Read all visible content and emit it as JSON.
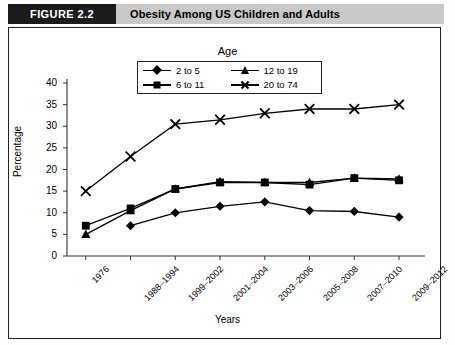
{
  "header": {
    "figure_tag": "FIGURE 2.2",
    "title": "Obesity Among US Children and Adults"
  },
  "chart_data": {
    "type": "line",
    "title": "Obesity Among US Children and Adults",
    "xlabel": "Years",
    "ylabel": "Percentage",
    "ylim": [
      0,
      40
    ],
    "ytick_values": [
      0,
      5,
      10,
      15,
      20,
      25,
      30,
      35,
      40
    ],
    "ytick_labels": [
      "0",
      "5",
      "10",
      "15",
      "20",
      "25",
      "30",
      "35",
      "40"
    ],
    "grid": false,
    "legend_title": "Age",
    "legend_position": "top-center",
    "categories": [
      "1976",
      "1988–1994",
      "1999–2002",
      "2001–2004",
      "2003–2006",
      "2005–2008",
      "2007–2010",
      "2009–2012"
    ],
    "series": [
      {
        "name": "2 to 5",
        "marker": "diamond",
        "values": [
          null,
          7.0,
          10.0,
          11.5,
          12.5,
          10.5,
          10.3,
          9.0
        ]
      },
      {
        "name": "6 to 11",
        "marker": "square",
        "values": [
          7.0,
          11.0,
          15.5,
          17.0,
          17.0,
          16.5,
          18.0,
          17.5
        ]
      },
      {
        "name": "12 to 19",
        "marker": "triangle",
        "values": [
          5.0,
          10.5,
          15.5,
          17.2,
          17.0,
          17.0,
          18.0,
          17.8
        ]
      },
      {
        "name": "20 to 74",
        "marker": "x",
        "values": [
          15.0,
          23.0,
          30.5,
          31.5,
          33.0,
          34.0,
          34.0,
          35.0
        ]
      }
    ]
  }
}
